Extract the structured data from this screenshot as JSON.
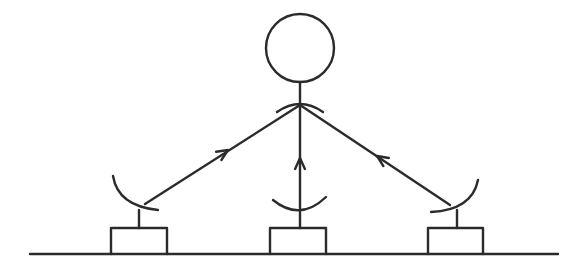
{
  "diagram": {
    "type": "satellite-relay-schematic",
    "colors": {
      "stroke": "#2b2b2b",
      "background": "#ffffff"
    },
    "satellite": {
      "cx": 300,
      "cy": 48,
      "r": 34,
      "stem_bottom_y": 107,
      "dish": {
        "x1": 277,
        "y1": 112,
        "cx": 300,
        "cy": 96,
        "x2": 323,
        "y2": 112
      }
    },
    "ground": {
      "x1": 30,
      "x2": 558,
      "y": 254
    },
    "stations": [
      {
        "id": "left",
        "box": {
          "x": 111,
          "y": 228,
          "w": 56,
          "h": 26
        },
        "stem_x": 139,
        "stem_top_y": 210,
        "dish": "M113,176 Q118,206 158,210",
        "signal_from": [
          145,
          204
        ],
        "arrow_at": [
          228,
          150
        ]
      },
      {
        "id": "center",
        "box": {
          "x": 270,
          "y": 228,
          "w": 56,
          "h": 26
        },
        "stem_x": 300,
        "stem_top_y": 210,
        "dish": "M273,200 Q300,222 326,197",
        "signal_from": [
          300,
          208
        ],
        "arrow_at": [
          300,
          158
        ]
      },
      {
        "id": "right",
        "box": {
          "x": 428,
          "y": 228,
          "w": 55,
          "h": 26
        },
        "stem_x": 457,
        "stem_top_y": 210,
        "dish": "M478,180 Q472,210 431,212",
        "signal_from": [
          450,
          205
        ],
        "arrow_at": [
          377,
          156
        ]
      }
    ],
    "hub": [
      300,
      105
    ],
    "labels": []
  }
}
